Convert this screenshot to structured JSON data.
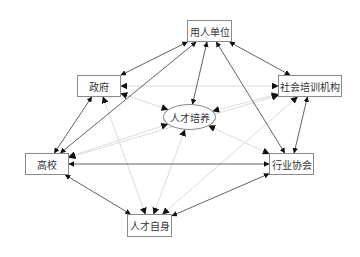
{
  "diagram": {
    "title": "",
    "nodes": [
      {
        "id": "employer",
        "label": "用人单位",
        "shape": "rect",
        "x": 187,
        "y": 20,
        "w": 45,
        "h": 22
      },
      {
        "id": "government",
        "label": "政府",
        "shape": "rect",
        "x": 77,
        "y": 75,
        "w": 44,
        "h": 22
      },
      {
        "id": "training",
        "label": "社会培训机构",
        "shape": "rect",
        "x": 278,
        "y": 75,
        "w": 64,
        "h": 22
      },
      {
        "id": "talent_cultivation",
        "label": "人才培养",
        "shape": "ellipse",
        "x": 163,
        "y": 104,
        "w": 53,
        "h": 26
      },
      {
        "id": "university",
        "label": "高校",
        "shape": "rect",
        "x": 25,
        "y": 153,
        "w": 44,
        "h": 22
      },
      {
        "id": "industry",
        "label": "行业协会",
        "shape": "rect",
        "x": 269,
        "y": 153,
        "w": 45,
        "h": 22
      },
      {
        "id": "self",
        "label": "人才自身",
        "shape": "rect",
        "x": 127,
        "y": 214,
        "w": 45,
        "h": 23
      }
    ],
    "edges": [
      {
        "from": "employer",
        "to": "government",
        "style": "dark",
        "bidirectional": true
      },
      {
        "from": "employer",
        "to": "training",
        "style": "dark",
        "bidirectional": true
      },
      {
        "from": "employer",
        "to": "talent_cultivation",
        "style": "dark",
        "bidirectional": true
      },
      {
        "from": "employer",
        "to": "university",
        "style": "dark",
        "bidirectional": true
      },
      {
        "from": "employer",
        "to": "industry",
        "style": "dark",
        "bidirectional": true
      },
      {
        "from": "government",
        "to": "university",
        "style": "dark",
        "bidirectional": true
      },
      {
        "from": "training",
        "to": "industry",
        "style": "dark",
        "bidirectional": true
      },
      {
        "from": "university",
        "to": "industry",
        "style": "dark",
        "bidirectional": true
      },
      {
        "from": "university",
        "to": "self",
        "style": "dark",
        "bidirectional": true
      },
      {
        "from": "industry",
        "to": "self",
        "style": "dark",
        "bidirectional": true
      },
      {
        "from": "government",
        "to": "training",
        "style": "light",
        "bidirectional": true
      },
      {
        "from": "government",
        "to": "talent_cultivation",
        "style": "light",
        "bidirectional": true
      },
      {
        "from": "government",
        "to": "self",
        "style": "light",
        "bidirectional": true
      },
      {
        "from": "training",
        "to": "talent_cultivation",
        "style": "light",
        "bidirectional": true
      },
      {
        "from": "training",
        "to": "university",
        "style": "light",
        "bidirectional": true
      },
      {
        "from": "training",
        "to": "self",
        "style": "light",
        "bidirectional": true
      },
      {
        "from": "talent_cultivation",
        "to": "university",
        "style": "light",
        "bidirectional": true
      },
      {
        "from": "talent_cultivation",
        "to": "industry",
        "style": "light",
        "bidirectional": true
      },
      {
        "from": "talent_cultivation",
        "to": "self",
        "style": "light",
        "bidirectional": true
      }
    ],
    "colors": {
      "dark_edge": "#3a3a3a",
      "light_edge": "#dcdcdc",
      "node_border": "#8a8a8a",
      "text": "#333333"
    }
  }
}
